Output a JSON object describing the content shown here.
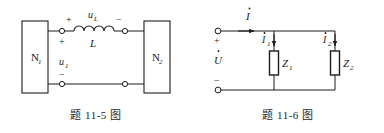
{
  "page": {
    "width": 384,
    "height": 133,
    "background": "#ffffff",
    "ink": "#1c1c1c"
  },
  "figures": [
    {
      "id": "figure-11-5",
      "caption": "题 11-5 图",
      "description": "Two-winding coupled circuit: block N1 on the left connected through an inductor L to block N2 on the right",
      "labels": {
        "left_block": "N",
        "left_block_sub": "1",
        "right_block": "N",
        "right_block_sub": "2",
        "inductor_voltage": "u",
        "inductor_voltage_sub": "L",
        "inductance": "L",
        "port_voltage": "u",
        "port_voltage_sub": "1",
        "plus_inductor": "+",
        "minus_inductor": "−",
        "plus_port": "+",
        "minus_port": "−"
      }
    },
    {
      "id": "figure-11-6",
      "caption": "题 11-6 图",
      "description": "Parallel AC circuit: source phasor voltage U drives two parallel impedances Z1 and Z2 with branch currents I1 and I2",
      "labels": {
        "source_voltage": "U",
        "total_current": "I",
        "branch1_current": "I",
        "branch1_current_sub": "1",
        "branch2_current": "I",
        "branch2_current_sub": "2",
        "impedance1": "Z",
        "impedance1_sub": "1",
        "impedance2": "Z",
        "impedance2_sub": "2",
        "plus_terminal": "+",
        "minus_terminal": "−"
      }
    }
  ]
}
